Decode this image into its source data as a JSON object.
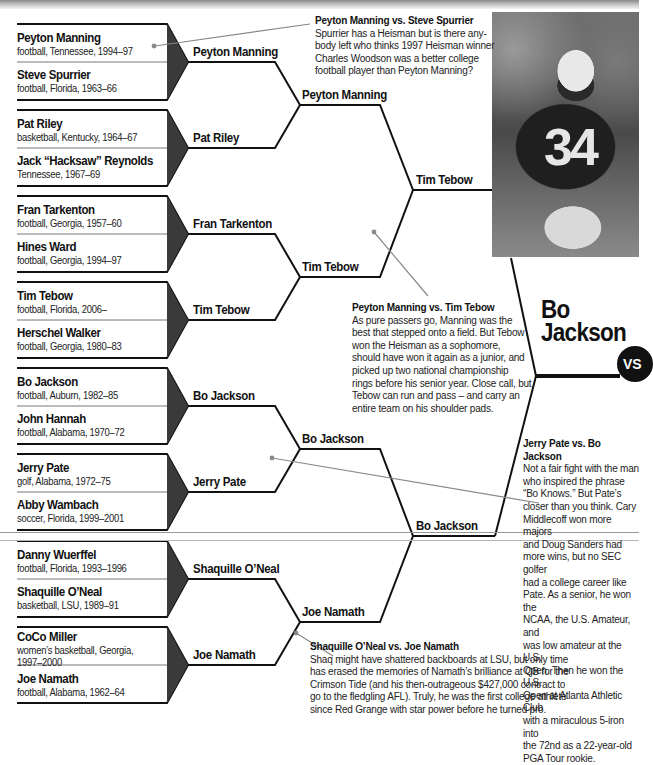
{
  "bracket": {
    "round1": [
      {
        "name": "Peyton Manning",
        "meta": "football, Tennessee, 1994–97"
      },
      {
        "name": "Steve Spurrier",
        "meta": "football, Florida, 1963–66"
      },
      {
        "name": "Pat Riley",
        "meta": "basketball, Kentucky, 1964–67"
      },
      {
        "name": "Jack “Hacksaw” Reynolds",
        "meta": "Tennessee, 1967–69"
      },
      {
        "name": "Fran Tarkenton",
        "meta": "football, Georgia, 1957–60"
      },
      {
        "name": "Hines Ward",
        "meta": "football, Georgia, 1994–97"
      },
      {
        "name": "Tim Tebow",
        "meta": "football, Florida, 2006–"
      },
      {
        "name": "Herschel Walker",
        "meta": "football, Georgia, 1980–83"
      },
      {
        "name": "Bo Jackson",
        "meta": "football, Auburn, 1982–85"
      },
      {
        "name": "John Hannah",
        "meta": "football, Alabama, 1970–72"
      },
      {
        "name": "Jerry Pate",
        "meta": "golf, Alabama, 1972–75"
      },
      {
        "name": "Abby Wambach",
        "meta": "soccer, Florida, 1999–2001"
      },
      {
        "name": "Danny Wuerffel",
        "meta": "football, Florida, 1993–1996"
      },
      {
        "name": "Shaquille O’Neal",
        "meta": "basketball, LSU, 1989–91"
      },
      {
        "name": "CoCo Miller",
        "meta": "women’s basketball, Georgia,",
        "meta2": "1997–2000"
      },
      {
        "name": "Joe Namath",
        "meta": "football, Alabama, 1962–64"
      }
    ],
    "round2": [
      "Peyton Manning",
      "Pat Riley",
      "Fran Tarkenton",
      "Tim Tebow",
      "Bo Jackson",
      "Jerry Pate",
      "Shaquille O’Neal",
      "Joe Namath"
    ],
    "round3": [
      "Peyton Manning",
      "Tim Tebow",
      "Bo Jackson",
      "Joe Namath"
    ],
    "round4": [
      "Tim Tebow",
      "Bo Jackson"
    ],
    "champion": {
      "line1": "Bo",
      "line2": "Jackson",
      "badge": "VS"
    }
  },
  "photo": {
    "jersey_number": "34"
  },
  "notes": [
    {
      "title": "Peyton Manning vs. Steve Spurrier",
      "lines": [
        "Spurrier has a Heisman but is there any-",
        "body left who thinks 1997 Heisman winner",
        "Charles Woodson was a better college",
        "football player than Peyton Manning?"
      ]
    },
    {
      "title": "Peyton Manning vs. Tim Tebow",
      "lines": [
        "As pure passers go, Manning was the",
        "best that stepped onto a field. But Tebow",
        "won the Heisman as a sophomore,",
        "should have won it again as a junior, and",
        "picked up two national championship",
        "rings before his senior year. Close call, but",
        "Tebow can run and pass – and carry an",
        "entire team on his shoulder pads."
      ]
    },
    {
      "title": "Jerry Pate vs. Bo Jackson",
      "lines": [
        "Not a fair fight with the man",
        "who inspired the phrase",
        "“Bo Knows.” But Pate’s",
        "closer than you think. Cary",
        "Middlecoff won more majors",
        "and Doug Sanders had",
        "more wins, but no SEC golfer",
        "had a college career like",
        "Pate. As a senior, he won the",
        "NCAA, the U.S. Amateur, and",
        "was low amateur at the U.S.",
        "Open. Then he won the U.S.",
        "Open at Atlanta Athletic Club",
        "with a miraculous 5-iron into",
        "the 72nd as a 22-year-old",
        "PGA Tour rookie."
      ]
    },
    {
      "title": "Shaquille O’Neal vs. Joe Namath",
      "lines": [
        "Shaq might have shattered backboards at LSU, but only time",
        "has erased the memories of Namath’s brilliance at QB for the",
        "Crimson Tide (and his then-outrageous $427,000 contract to",
        "go to the fledgling AFL). Truly, he was the first college athlete",
        "since Red Grange with star power before he turned pro."
      ]
    }
  ],
  "colors": {
    "line": "#111111",
    "triangle": "#3a3a3a",
    "pointer": "#888888"
  }
}
